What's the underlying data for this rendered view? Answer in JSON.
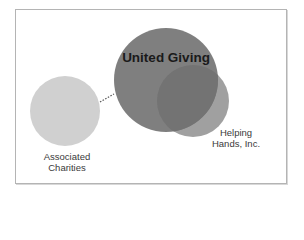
{
  "diagram": {
    "type": "venn-relationship",
    "entities": [
      {
        "id": "united-giving",
        "label": "United Giving",
        "color": "#7b7b7b"
      },
      {
        "id": "helping-hands",
        "label_line1": "Helping",
        "label_line2": "Hands, Inc.",
        "color": "#a0a0a0",
        "overlap_color": "#737373"
      },
      {
        "id": "associated-charities",
        "label_line1": "Associated",
        "label_line2": "Charities",
        "color": "#d0d0d0"
      }
    ],
    "connectors": [
      {
        "from": "associated-charities",
        "to": "united-giving",
        "style": "dotted",
        "color": "#555555"
      }
    ]
  }
}
